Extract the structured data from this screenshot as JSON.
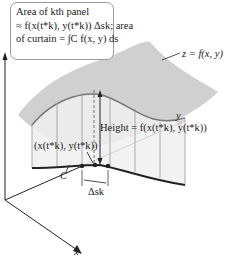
{
  "callout": {
    "line1": "Area of kth panel",
    "line2": "≈ f(x(t*k), y(t*k)) Δsk; area",
    "line3": "of curtain = ∫C f(x, y) ds"
  },
  "labels": {
    "surface": "z = f(x, y)",
    "height": "Height = f(x(t*k), y(t*k))",
    "point": "(x(t*k), y(t*k))",
    "curve": "C",
    "delta_s": "Δsk",
    "axis_x": "x",
    "axis_y": "y"
  },
  "colors": {
    "surface": "#c9c9c9",
    "curtain": "#efefef",
    "curve": "#222222",
    "panel_lines": "#9a9a9a"
  }
}
